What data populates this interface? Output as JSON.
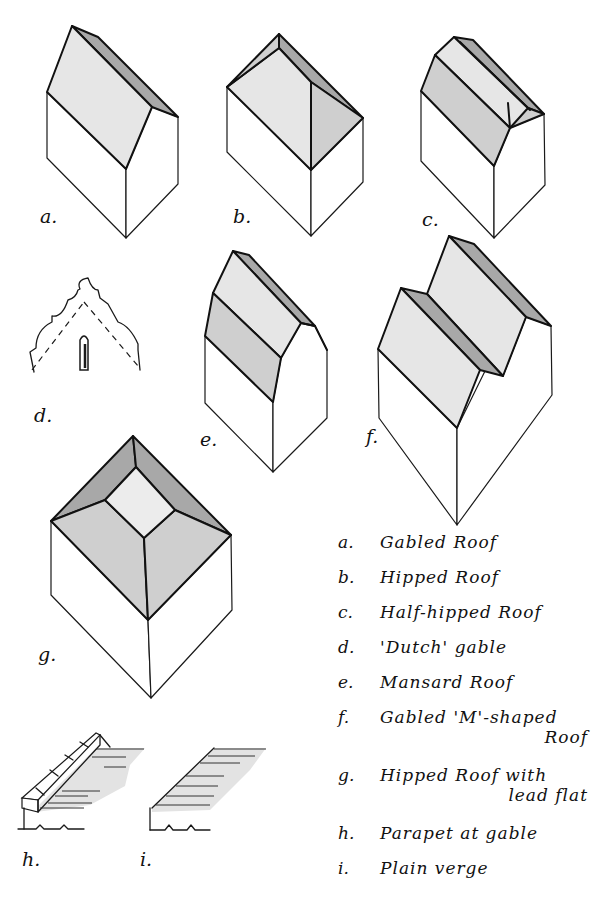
{
  "figures": [
    {
      "key": "a.",
      "name": "Gabled Roof"
    },
    {
      "key": "b.",
      "name": "Hipped Roof"
    },
    {
      "key": "c.",
      "name": "Half-hipped Roof"
    },
    {
      "key": "d.",
      "name": "'Dutch' gable"
    },
    {
      "key": "e.",
      "name": "Mansard Roof"
    },
    {
      "key": "f.",
      "name": "Gabled 'M'-shaped",
      "name2": "Roof"
    },
    {
      "key": "g.",
      "name": "Hipped Roof with",
      "name2": "lead flat"
    },
    {
      "key": "h.",
      "name": "Parapet at gable"
    },
    {
      "key": "i.",
      "name": "Plain verge"
    }
  ],
  "colors": {
    "line": "#1a1a1a",
    "roof_light": "#e6e6e6",
    "roof_mid": "#cfcfcf",
    "roof_dark": "#a8a8a8",
    "background": "#ffffff"
  }
}
